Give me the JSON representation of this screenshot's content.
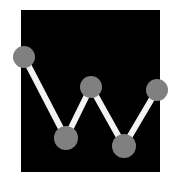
{
  "graphic": {
    "title": "zigzag-line-chart-logo",
    "alt_label": "Zigzag line chart icon on black panel",
    "canvas": {
      "width": 178,
      "height": 188,
      "background_color": "#ffffff"
    },
    "panel": {
      "name": "black-panel",
      "x": 21,
      "y": 10,
      "width": 139,
      "height": 162,
      "fill_color": "#000000"
    },
    "style": {
      "node_fill_color": "#808080",
      "line_color": "#f2f2f2",
      "line_width": 6,
      "line_cap": "round"
    }
  },
  "chart_data": {
    "type": "line",
    "subtitle": "",
    "xlabel": "",
    "ylabel": "",
    "grid": false,
    "legend": "none",
    "axis_visible": false,
    "tick_labels_visible": false,
    "xlim": [
      0,
      4
    ],
    "ylim": [
      0,
      100
    ],
    "x": [
      0,
      1,
      2,
      3,
      4
    ],
    "categories": [
      "1",
      "2",
      "3",
      "4",
      "5"
    ],
    "series": [
      {
        "name": "series-1",
        "values": [
          78,
          24,
          56,
          19,
          54
        ],
        "marker": "circle",
        "marker_color": "#808080",
        "line_color": "#f2f2f2"
      }
    ],
    "points": [
      {
        "label": "1",
        "x": 24,
        "y": 57,
        "r": 11,
        "value": 78
      },
      {
        "label": "2",
        "x": 66,
        "y": 138,
        "r": 12,
        "value": 24
      },
      {
        "label": "3",
        "x": 91,
        "y": 87,
        "r": 11,
        "value": 56
      },
      {
        "label": "4",
        "x": 124,
        "y": 146,
        "r": 12,
        "value": 19
      },
      {
        "label": "5",
        "x": 157,
        "y": 90,
        "r": 11,
        "value": 54
      }
    ],
    "segments": [
      {
        "from": "1",
        "to": "2",
        "x1": 24,
        "y1": 57,
        "x2": 66,
        "y2": 138
      },
      {
        "from": "2",
        "to": "3",
        "x1": 66,
        "y1": 138,
        "x2": 91,
        "y2": 87
      },
      {
        "from": "3",
        "to": "4",
        "x1": 91,
        "y1": 87,
        "x2": 124,
        "y2": 146
      },
      {
        "from": "4",
        "to": "5",
        "x1": 124,
        "y1": 146,
        "x2": 157,
        "y2": 90
      }
    ]
  }
}
